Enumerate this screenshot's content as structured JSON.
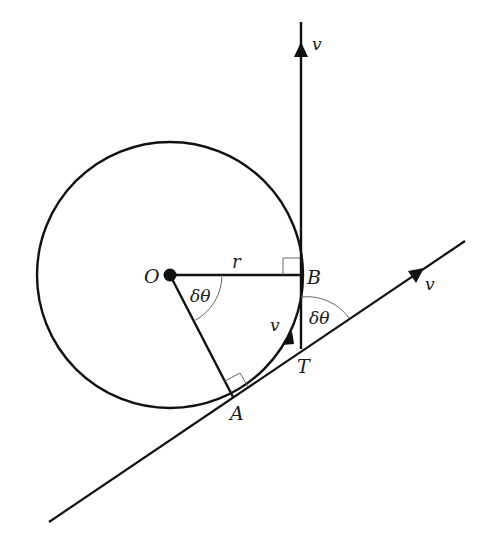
{
  "diagram": {
    "points": {
      "O": {
        "label": "O",
        "x": 170,
        "y": 275
      },
      "A": {
        "label": "A",
        "x": 234,
        "y": 396
      },
      "B": {
        "label": "B",
        "x": 302,
        "y": 275
      },
      "T": {
        "label": "T",
        "x": 302,
        "y": 349
      }
    },
    "labels": {
      "O": "O",
      "A": "A",
      "B": "B",
      "T": "T",
      "r": "r",
      "angle_O": "δθ",
      "angle_T": "δθ",
      "v_vertical": "v",
      "v_tangent": "v",
      "v_arc": "v"
    },
    "circle": {
      "cx": 170,
      "cy": 275,
      "r": 133
    },
    "colors": {
      "stroke": "#111111",
      "thin_stroke": "#555555",
      "background": "#ffffff"
    }
  }
}
